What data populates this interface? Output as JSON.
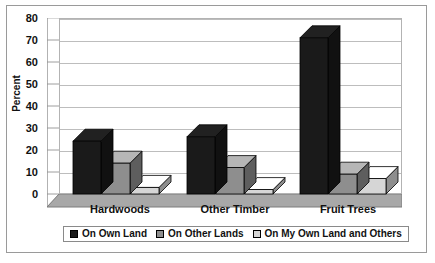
{
  "chart_data": {
    "type": "bar",
    "title": "",
    "subtitle": "",
    "xlabel": "",
    "ylabel": "Percent",
    "ylim": [
      0,
      80
    ],
    "yticks": [
      0,
      10,
      20,
      30,
      40,
      50,
      60,
      70,
      80
    ],
    "ytick_labels": [
      "0",
      "10",
      "20",
      "30",
      "40",
      "50",
      "60",
      "70",
      "80"
    ],
    "grid": true,
    "grid_axis": "y",
    "legend_position": "bottom",
    "style": "3d-clustered-column-grayscale",
    "categories": [
      "Hardwoods",
      "Other Timber",
      "Fruit Trees"
    ],
    "series": [
      {
        "name": "On Own Land",
        "color": "#1a1a1a",
        "values": [
          24,
          26,
          71
        ]
      },
      {
        "name": "On Other Lands",
        "color": "#8e8e8e",
        "values": [
          14,
          12,
          9
        ]
      },
      {
        "name": "On My Own Land and Others",
        "color": "#d6d6d6",
        "values": [
          3,
          2,
          7
        ]
      }
    ],
    "annotations": []
  },
  "axes": {
    "y_title": "Percent",
    "y_tick_0": "0",
    "y_tick_10": "10",
    "y_tick_20": "20",
    "y_tick_30": "30",
    "y_tick_40": "40",
    "y_tick_50": "50",
    "y_tick_60": "60",
    "y_tick_70": "70",
    "y_tick_80": "80"
  },
  "categories": {
    "c0": "Hardwoods",
    "c1": "Other Timber",
    "c2": "Fruit Trees"
  },
  "legend": {
    "items": [
      {
        "label": "On Own Land",
        "color": "#1a1a1a"
      },
      {
        "label": "On Other Lands",
        "color": "#8e8e8e"
      },
      {
        "label": "On My Own Land and Others",
        "color": "#d6d6d6"
      }
    ]
  },
  "colors": {
    "series_1": "#1a1a1a",
    "series_2": "#8e8e8e",
    "series_3": "#d6d6d6",
    "gridline": "#bdbdbd",
    "frame": "#9a9a9a",
    "floor": "#a8a8a8",
    "background": "#ffffff"
  }
}
